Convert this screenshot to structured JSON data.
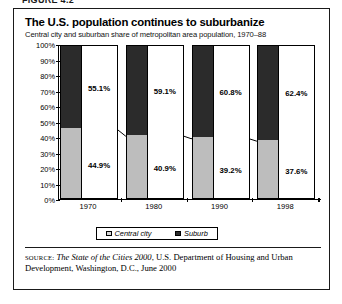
{
  "figure": {
    "label": "FIGURE 4.2"
  },
  "header": {
    "title": "The U.S. population continues to suburbanize",
    "subtitle": "Central city and suburban share of metropolitan area population, 1970–88"
  },
  "legend": {
    "central_label": "Central city",
    "suburb_label": "Suburb"
  },
  "source": {
    "kicker": "source:",
    "publication": "The State of the Cities 2000",
    "rest": ", U.S. Department of Housing and Urban Development, Washington, D.C., June 2000"
  },
  "colors": {
    "central_city": "#bdbdbd",
    "suburb": "#2b2b2b",
    "axis": "#000000",
    "background": "#ffffff"
  },
  "chart_data": {
    "type": "bar",
    "subtype": "stacked-100-percent",
    "title": "The U.S. population continues to suburbanize",
    "subtitle": "Central city and suburban share of metropolitan area population, 1970–88",
    "xlabel": "",
    "ylabel": "",
    "ylim": [
      0,
      100
    ],
    "yticks": [
      0,
      10,
      20,
      30,
      40,
      50,
      60,
      70,
      80,
      90,
      100
    ],
    "ytick_labels": [
      "0%",
      "10%",
      "20%",
      "30%",
      "40%",
      "50%",
      "60%",
      "70%",
      "80%",
      "90%",
      "100%"
    ],
    "grid": false,
    "legend_position": "bottom",
    "categories": [
      "1970",
      "1980",
      "1990",
      "1998"
    ],
    "series": [
      {
        "name": "Central city",
        "values": [
          44.9,
          40.9,
          39.2,
          37.6
        ],
        "value_labels": [
          "44.9%",
          "40.9%",
          "39.2%",
          "37.6%"
        ],
        "color": "#bdbdbd"
      },
      {
        "name": "Suburb",
        "values": [
          55.1,
          59.1,
          60.8,
          62.4
        ],
        "value_labels": [
          "55.1%",
          "59.1%",
          "60.8%",
          "62.4%"
        ],
        "color": "#2b2b2b"
      }
    ],
    "annotations": [
      {
        "type": "trend-line",
        "description": "Line connecting the top of each central city segment",
        "values": [
          44.9,
          40.9,
          39.2,
          37.6
        ]
      }
    ]
  }
}
